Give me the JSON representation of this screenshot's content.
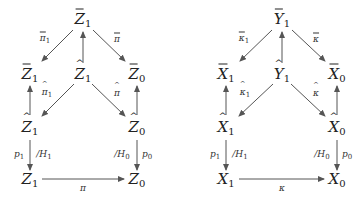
{
  "diagrams": [
    {
      "name": "Z-diagram",
      "nodes": {
        "top": {
          "base": "Z",
          "sub": "1",
          "decor": "bar",
          "x": 83,
          "y": 20
        },
        "mid_left": {
          "base": "Z",
          "sub": "1",
          "decor": "bar",
          "x": 30,
          "y": 75
        },
        "mid_center": {
          "base": "Z",
          "sub": "1",
          "decor": "hat",
          "x": 83,
          "y": 75
        },
        "mid_right": {
          "base": "Z",
          "sub": "0",
          "decor": "bar",
          "x": 137,
          "y": 75
        },
        "low_left": {
          "base": "Z",
          "sub": "1",
          "decor": "hat",
          "x": 30,
          "y": 128
        },
        "low_right": {
          "base": "Z",
          "sub": "0",
          "decor": "hat",
          "x": 137,
          "y": 128
        },
        "bot_left": {
          "base": "Z",
          "sub": "1",
          "decor": "none",
          "x": 30,
          "y": 180
        },
        "bot_right": {
          "base": "Z",
          "sub": "0",
          "decor": "none",
          "x": 137,
          "y": 180
        }
      },
      "labels": {
        "top_to_left": {
          "base": "π",
          "sub": "1",
          "decor": "bar"
        },
        "top_to_right": {
          "base": "π",
          "sub": "",
          "decor": "bar"
        },
        "center_to_lowleft": {
          "base": "π",
          "sub": "1",
          "decor": "hat"
        },
        "center_to_lowright": {
          "base": "π",
          "sub": "",
          "decor": "hat"
        },
        "left_p": {
          "base": "p",
          "sub": "1"
        },
        "left_h": {
          "base": "/H",
          "sub": "1"
        },
        "right_h": {
          "base": "/H",
          "sub": "0"
        },
        "right_p": {
          "base": "p",
          "sub": "0"
        },
        "bottom": {
          "base": "π",
          "sub": ""
        }
      }
    },
    {
      "name": "XY-diagram",
      "nodes": {
        "top": {
          "base": "Y",
          "sub": "1",
          "decor": "bar",
          "x": 282,
          "y": 20
        },
        "mid_left": {
          "base": "X",
          "sub": "1",
          "decor": "bar",
          "x": 226,
          "y": 75
        },
        "mid_center": {
          "base": "Y",
          "sub": "1",
          "decor": "hat",
          "x": 282,
          "y": 75
        },
        "mid_right": {
          "base": "X",
          "sub": "0",
          "decor": "bar",
          "x": 337,
          "y": 75
        },
        "low_left": {
          "base": "X",
          "sub": "1",
          "decor": "hat",
          "x": 226,
          "y": 128
        },
        "low_right": {
          "base": "X",
          "sub": "0",
          "decor": "hat",
          "x": 337,
          "y": 128
        },
        "bot_left": {
          "base": "X",
          "sub": "1",
          "decor": "none",
          "x": 226,
          "y": 180
        },
        "bot_right": {
          "base": "X",
          "sub": "0",
          "decor": "none",
          "x": 337,
          "y": 180
        }
      },
      "labels": {
        "top_to_left": {
          "base": "κ",
          "sub": "1",
          "decor": "bar"
        },
        "top_to_right": {
          "base": "κ",
          "sub": "",
          "decor": "bar"
        },
        "center_to_lowleft": {
          "base": "κ",
          "sub": "1",
          "decor": "hat"
        },
        "center_to_lowright": {
          "base": "κ",
          "sub": "",
          "decor": "hat"
        },
        "left_p": {
          "base": "p",
          "sub": "1"
        },
        "left_h": {
          "base": "/H",
          "sub": "1"
        },
        "right_h": {
          "base": "/H",
          "sub": "0"
        },
        "right_p": {
          "base": "p",
          "sub": "0"
        },
        "bottom": {
          "base": "κ",
          "sub": ""
        }
      }
    }
  ],
  "hat_glyph": "^",
  "colors": {
    "ink": "#222222",
    "arrow": "#555555",
    "background": "#ffffff"
  }
}
